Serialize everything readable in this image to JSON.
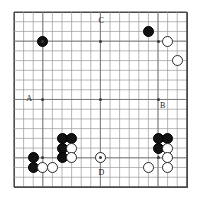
{
  "diagram": {
    "type": "go-game-board",
    "board_size": 19,
    "geometry": {
      "left": 14,
      "top": 12,
      "width": 174,
      "height": 176,
      "spacing_x": 9.6,
      "spacing_y": 9.72,
      "stone_diameter": 11
    },
    "colors": {
      "board_background": "#ffffff",
      "grid_line": "#9a9a9a",
      "border": "#4a4a4a",
      "black_stone": "#121212",
      "white_stone": "#ffffff",
      "white_stone_edge": "#2b2b2b",
      "label_text": "#1a1a1a",
      "star_point": "#3a3a3a"
    },
    "star_points": [
      {
        "col": 3,
        "row": 3
      },
      {
        "col": 9,
        "row": 3
      },
      {
        "col": 15,
        "row": 3
      },
      {
        "col": 3,
        "row": 9
      },
      {
        "col": 9,
        "row": 9
      },
      {
        "col": 15,
        "row": 9
      },
      {
        "col": 3,
        "row": 15
      },
      {
        "col": 9,
        "row": 15
      },
      {
        "col": 15,
        "row": 15
      }
    ],
    "black_stones": [
      {
        "col": 3,
        "row": 3
      },
      {
        "col": 14,
        "row": 2
      },
      {
        "col": 5,
        "row": 13
      },
      {
        "col": 6,
        "row": 13
      },
      {
        "col": 5,
        "row": 14
      },
      {
        "col": 5,
        "row": 15
      },
      {
        "col": 2,
        "row": 15
      },
      {
        "col": 2,
        "row": 16
      },
      {
        "col": 15,
        "row": 13
      },
      {
        "col": 16,
        "row": 13
      },
      {
        "col": 15,
        "row": 14
      }
    ],
    "white_stones": [
      {
        "col": 16,
        "row": 3
      },
      {
        "col": 17,
        "row": 5
      },
      {
        "col": 6,
        "row": 14
      },
      {
        "col": 6,
        "row": 15
      },
      {
        "col": 9,
        "row": 15
      },
      {
        "col": 3,
        "row": 16
      },
      {
        "col": 4,
        "row": 16
      },
      {
        "col": 16,
        "row": 14
      },
      {
        "col": 16,
        "row": 15
      },
      {
        "col": 14,
        "row": 16
      },
      {
        "col": 16,
        "row": 16
      }
    ],
    "point_labels": [
      {
        "name": "A",
        "text": "A",
        "col": 2,
        "row": 9,
        "dx": -7,
        "dy": -4
      },
      {
        "name": "B",
        "text": "B",
        "col": 15,
        "row": 9,
        "dx": 2,
        "dy": 3
      },
      {
        "name": "C",
        "text": "C",
        "col": 9,
        "row": 1,
        "dx": -2,
        "dy": -5
      },
      {
        "name": "D",
        "text": "D",
        "col": 9,
        "row": 16,
        "dx": -2,
        "dy": 1
      }
    ]
  }
}
